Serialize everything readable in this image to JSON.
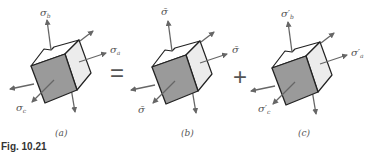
{
  "figure": {
    "caption": "Fig. 10.21",
    "operators": {
      "equals": "=",
      "plus": "+"
    },
    "colors": {
      "front_face": "#9a9a9a",
      "side_face": "#ececec",
      "edge": "#222222",
      "arrow": "#666666",
      "label": "#555555"
    },
    "panels": [
      {
        "id": "a",
        "sublabel": "(a)",
        "labels": {
          "top": "σ",
          "top_sub": "b",
          "right": "σ",
          "right_sub": "a",
          "front": "σ",
          "front_sub": "c"
        }
      },
      {
        "id": "b",
        "sublabel": "(b)",
        "labels": {
          "top": "σ̄",
          "top_sub": "",
          "right": "σ̄",
          "right_sub": "",
          "front": "σ̄",
          "front_sub": ""
        }
      },
      {
        "id": "c",
        "sublabel": "(c)",
        "labels": {
          "top": "σ′",
          "top_sub": "b",
          "right": "σ′",
          "right_sub": "a",
          "front": "σ′",
          "front_sub": "c"
        }
      }
    ]
  }
}
